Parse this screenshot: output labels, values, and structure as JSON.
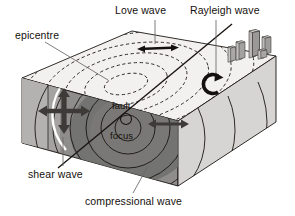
{
  "figure": {
    "kind": "earthquake-seismic-wave-block-diagram",
    "background_color": "#ffffff",
    "line_color": "#1a1512"
  },
  "labels": {
    "love_wave": "Love wave",
    "rayleigh_wave": "Rayleigh wave",
    "epicentre": "epicentre",
    "shear_wave": "shear wave",
    "compressional_wave": "compressional wave",
    "fault": "fault",
    "focus": "focus"
  },
  "icons": {
    "love_wave_arrow": "horizontal-double-arrow-icon",
    "rayleigh_wave_arrow": "circular-rotation-arrow-icon",
    "shear_wave_arrow": "cross-four-way-arrow-icon",
    "compressional_wave_arrow": "horizontal-double-arrow-icon",
    "focus_marker": "small-circle-icon",
    "buildings": "city-buildings-icon"
  },
  "block": {
    "top_face_color": "#f2f1ef",
    "front_face_color": "#8e8d8b",
    "left_face_color": "#b3b2b0",
    "right_face_color": "#d6d5d3",
    "inner_front_shade": "#6f6e6c",
    "fault_line_color": "#1a1512"
  },
  "waves": {
    "ring_style": "dashed",
    "ring_count_top": 5,
    "ring_count_front": 5,
    "highlight_arc_color": "#ffffff"
  }
}
